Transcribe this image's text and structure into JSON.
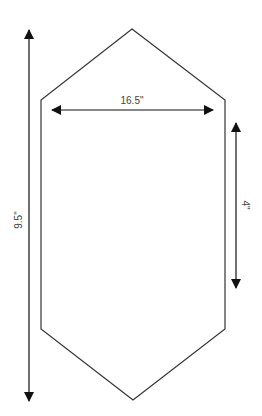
{
  "diagram": {
    "title": "",
    "shape": "elongated hexagon",
    "colors": {
      "background": "#ffffff",
      "outline": "#333333",
      "arrow": "#111111",
      "label": "#444444"
    },
    "dimensions": {
      "width_label": "16.5\"",
      "height_label": "9.5\"",
      "side_label": "4\""
    }
  }
}
